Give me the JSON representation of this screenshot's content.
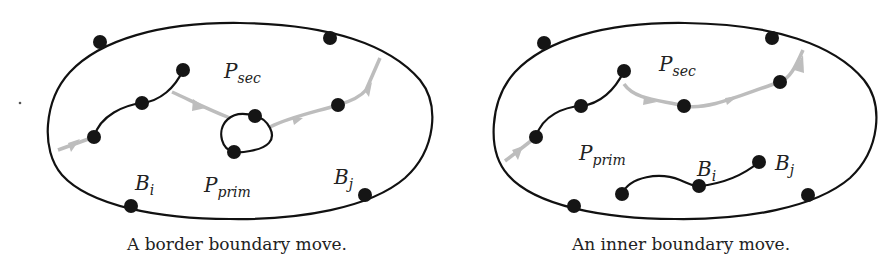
{
  "figures": [
    {
      "id": "border",
      "caption": "A border boundary move.",
      "labels": {
        "p_sec": {
          "main": "P",
          "sub": "sec"
        },
        "p_prim": {
          "main": "P",
          "sub": "prim"
        },
        "b_i": {
          "main": "B",
          "sub": "i"
        },
        "b_j": {
          "main": "B",
          "sub": "j"
        }
      }
    },
    {
      "id": "inner",
      "caption": "An inner boundary move.",
      "labels": {
        "p_sec": {
          "main": "P",
          "sub": "sec"
        },
        "p_prim": {
          "main": "P",
          "sub": "prim"
        },
        "b_i": {
          "main": "B",
          "sub": "i"
        },
        "b_j": {
          "main": "B",
          "sub": "j"
        }
      }
    }
  ],
  "colors": {
    "stroke": "#111111",
    "node": "#151515",
    "gray_path": "#bdbdbd"
  }
}
